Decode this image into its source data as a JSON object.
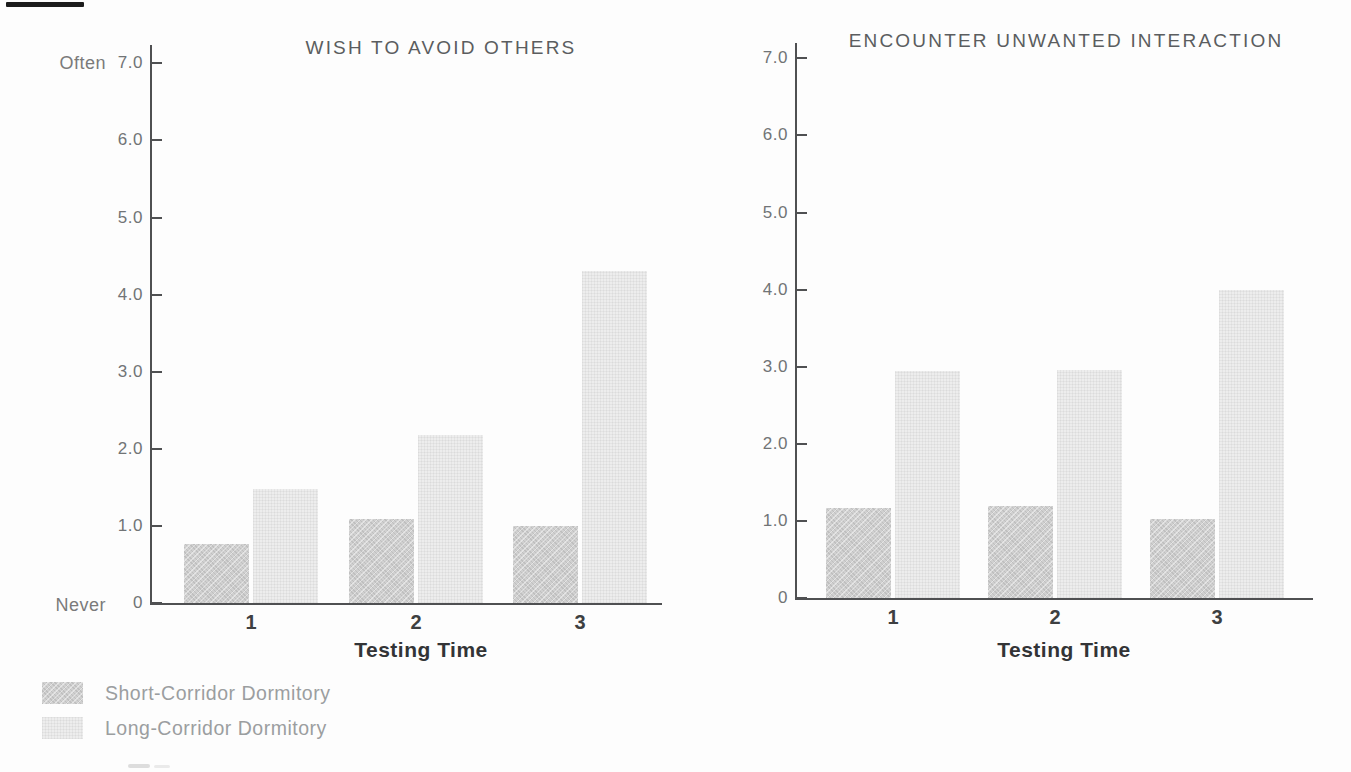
{
  "figure": {
    "background": "#fdfdfd",
    "axis_color": "#4f5052",
    "short_corridor_fill": "#d0d0d0",
    "long_corridor_fill": "#ededed"
  },
  "legend": {
    "items": [
      {
        "label": "Short-Corridor Dormitory",
        "color": "#d0d0d0",
        "pattern": "diagonal-hatch"
      },
      {
        "label": "Long-Corridor Dormitory",
        "color": "#ededed",
        "pattern": "fine-dots"
      }
    ]
  },
  "chart_data": [
    {
      "type": "bar",
      "title": "WISH TO AVOID OTHERS",
      "categories": [
        "1",
        "2",
        "3"
      ],
      "series": [
        {
          "name": "Short-Corridor Dormitory",
          "values": [
            0.76,
            1.09,
            1.0
          ]
        },
        {
          "name": "Long-Corridor Dormitory",
          "values": [
            1.48,
            2.18,
            4.3
          ]
        }
      ],
      "xlabel": "Testing Time",
      "ylabel": "",
      "ylim": [
        0,
        7
      ],
      "yticks": [
        0,
        1,
        2,
        3,
        4,
        5,
        6,
        7
      ],
      "ytick_labels": [
        "0",
        "1.0",
        "2.0",
        "3.0",
        "4.0",
        "5.0",
        "6.0",
        "7.0"
      ],
      "y_axis_top_annotation": "Often",
      "y_axis_bottom_annotation": "Never",
      "grid": false,
      "legend_position": "below-left"
    },
    {
      "type": "bar",
      "title": "ENCOUNTER UNWANTED INTERACTION",
      "categories": [
        "1",
        "2",
        "3"
      ],
      "series": [
        {
          "name": "Short-Corridor Dormitory",
          "values": [
            1.17,
            1.19,
            1.02
          ]
        },
        {
          "name": "Long-Corridor Dormitory",
          "values": [
            2.95,
            2.96,
            4.0
          ]
        }
      ],
      "xlabel": "Testing Time",
      "ylabel": "",
      "ylim": [
        0,
        7
      ],
      "yticks": [
        0,
        1,
        2,
        3,
        4,
        5,
        6,
        7
      ],
      "ytick_labels": [
        "0",
        "1.0",
        "2.0",
        "3.0",
        "4.0",
        "5.0",
        "6.0",
        "7.0"
      ],
      "grid": false
    }
  ]
}
